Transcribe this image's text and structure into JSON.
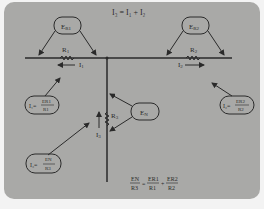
{
  "diagram": {
    "title_equation": "I₃ = I₁ + I₂",
    "colors": {
      "panel": "#a9a9a7",
      "ink": "#2a2a2a",
      "page": "#f3f3f3"
    },
    "bubbles": {
      "er1": {
        "label": "E",
        "sub": "R1"
      },
      "er2": {
        "label": "E",
        "sub": "R2"
      },
      "en": {
        "label": "E",
        "sub": "N"
      },
      "i1_formula": {
        "lhs": "I₁=",
        "num": "ER1",
        "den": "R1"
      },
      "i2_formula": {
        "lhs": "I₂=",
        "num": "ER2",
        "den": "R2"
      },
      "i3_formula": {
        "lhs": "I₃=",
        "num": "EN",
        "den": "R3"
      }
    },
    "components": {
      "r1": {
        "label": "R",
        "sub": "1"
      },
      "r2": {
        "label": "R",
        "sub": "2"
      },
      "r3": {
        "label": "R",
        "sub": "3"
      }
    },
    "currents": {
      "i1": {
        "label": "I",
        "sub": "1"
      },
      "i2": {
        "label": "I",
        "sub": "2"
      },
      "i3": {
        "label": "I",
        "sub": "3"
      }
    },
    "bottom_equation": {
      "terms": [
        {
          "num": "EN",
          "den": "R3"
        },
        {
          "num": "ER1",
          "den": "R1"
        },
        {
          "num": "ER2",
          "den": "R2"
        }
      ],
      "operators": [
        "=",
        "+"
      ]
    }
  }
}
